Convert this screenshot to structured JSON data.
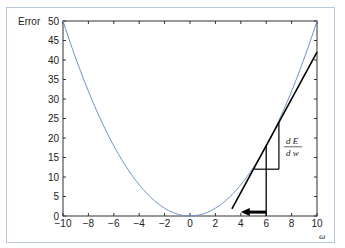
{
  "chart_data": {
    "type": "line",
    "title": "",
    "xlabel": "ω",
    "ylabel": "Error",
    "xlim": [
      -10,
      10
    ],
    "ylim": [
      0,
      50
    ],
    "xticks": [
      "-10",
      "-8",
      "-6",
      "-4",
      "-2",
      "0",
      "2",
      "4",
      "6",
      "8",
      "10"
    ],
    "yticks": [
      "0",
      "5",
      "10",
      "15",
      "20",
      "25",
      "30",
      "35",
      "40",
      "45",
      "50"
    ],
    "grid": false,
    "series": [
      {
        "name": "Error curve E = w²/2",
        "color": "#6a8fd0",
        "x": [
          -10,
          -8,
          -6,
          -4,
          -2,
          0,
          2,
          4,
          6,
          8,
          10
        ],
        "y": [
          50,
          32,
          18,
          8,
          2,
          0,
          2,
          8,
          18,
          32,
          50
        ]
      },
      {
        "name": "Tangent at w=6",
        "color": "#000000",
        "x": [
          3.3,
          10
        ],
        "y": [
          1.8,
          42
        ]
      }
    ],
    "annotations": [
      {
        "type": "slope-triangle",
        "x0": 5,
        "x1": 7,
        "y0": 12,
        "y1": 24,
        "label": "dE/dw"
      },
      {
        "type": "vertical-line",
        "x": 6,
        "y0": 0,
        "y1": 18
      },
      {
        "type": "arrow",
        "from": [
          6,
          1
        ],
        "to": [
          4,
          1
        ],
        "direction": "left"
      }
    ]
  },
  "labels": {
    "ylabel": "Error",
    "xlabel": "ω",
    "deriv_num": "d E",
    "deriv_den": "d w"
  }
}
